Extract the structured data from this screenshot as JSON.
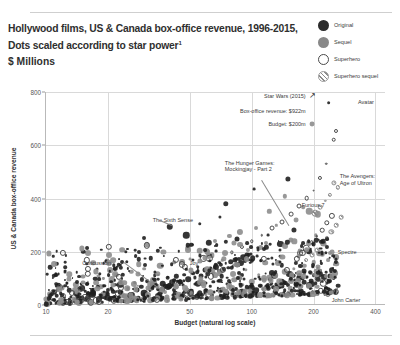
{
  "header": {
    "title_line1": "Hollywood films, US & Canada box-office revenue, 1996-2015,",
    "title_line2": "Dots scaled according to star power",
    "title_line2_footnote": "1",
    "units": "$ Millions"
  },
  "legend": {
    "position": "top-right",
    "items": [
      {
        "label": "Original",
        "marker": "filled-dark-circle",
        "color": "#2b2b2b"
      },
      {
        "label": "Sequel",
        "marker": "filled-gray-circle",
        "color": "#888888"
      },
      {
        "label": "Superhero",
        "marker": "hollow-circle",
        "color": "#4a4a4a"
      },
      {
        "label": "Superhero sequel",
        "marker": "hatched-circle",
        "color": "#8a8a8a"
      }
    ]
  },
  "chart_data": {
    "type": "scatter",
    "title": "Hollywood films, US & Canada box-office revenue, 1996-2015, Dots scaled according to star power",
    "subtitle": "$ Millions",
    "xlabel": "Budget (natural log scale)",
    "ylabel": "US & Canada box-office revenue",
    "xscale": "log",
    "xlim": [
      10,
      450
    ],
    "ylim": [
      0,
      800
    ],
    "xticks": [
      10,
      20,
      50,
      100,
      200,
      400
    ],
    "yticks": [
      0,
      200,
      400,
      600,
      800
    ],
    "grid": true,
    "size_encodes": "star power",
    "legend_position": "top-right",
    "series": [
      {
        "name": "Original",
        "marker": "filled-dark-circle"
      },
      {
        "name": "Sequel",
        "marker": "filled-gray-circle"
      },
      {
        "name": "Superhero",
        "marker": "hollow-circle"
      },
      {
        "name": "Superhero sequel",
        "marker": "hatched-circle"
      }
    ],
    "annotations": [
      {
        "label": "Star Wars (2015)",
        "detail_revenue": "Box-office revenue: $922m",
        "detail_budget": "Budget: $200m",
        "x": 200,
        "y": 922,
        "arrow": "up-right"
      },
      {
        "label": "Avatar",
        "x": 237,
        "y": 760
      },
      {
        "label": "The Avengers:",
        "label2": "Age of Ultron",
        "x": 250,
        "y": 459
      },
      {
        "label": "The Hunger Games:",
        "label2": "Mockingjay - Part 2",
        "x": 160,
        "y": 281
      },
      {
        "label": "Furious 7",
        "x": 190,
        "y": 353
      },
      {
        "label": "The Sixth Sense",
        "x": 40,
        "y": 293
      },
      {
        "label": "Concussion",
        "x": 35,
        "y": 34
      },
      {
        "label": "Joy",
        "x": 60,
        "y": 56
      },
      {
        "label": "Spectre",
        "x": 245,
        "y": 200
      },
      {
        "label": "John Carter",
        "x": 263,
        "y": 73
      }
    ],
    "points": {
      "original": [
        [
          237,
          760
        ],
        [
          150,
          474
        ],
        [
          40,
          293
        ],
        [
          103,
          436
        ],
        [
          75,
          380
        ],
        [
          70,
          330
        ],
        [
          56,
          305
        ],
        [
          48,
          262
        ],
        [
          30,
          250
        ],
        [
          36,
          215
        ],
        [
          62,
          234
        ],
        [
          85,
          248
        ],
        [
          95,
          232
        ],
        [
          120,
          262
        ],
        [
          138,
          230
        ],
        [
          160,
          281
        ],
        [
          175,
          220
        ],
        [
          200,
          230
        ],
        [
          190,
          200
        ],
        [
          215,
          212
        ],
        [
          230,
          196
        ],
        [
          263,
          73
        ],
        [
          210,
          140
        ],
        [
          180,
          128
        ],
        [
          160,
          110
        ],
        [
          140,
          150
        ],
        [
          125,
          120
        ],
        [
          110,
          96
        ],
        [
          100,
          165
        ],
        [
          90,
          112
        ],
        [
          80,
          140
        ],
        [
          70,
          92
        ],
        [
          60,
          105
        ],
        [
          52,
          120
        ],
        [
          45,
          88
        ],
        [
          40,
          72
        ],
        [
          35,
          60
        ],
        [
          30,
          44
        ],
        [
          26,
          38
        ],
        [
          22,
          50
        ],
        [
          19,
          34
        ],
        [
          17,
          60
        ],
        [
          15,
          28
        ],
        [
          14,
          44
        ],
        [
          13,
          22
        ],
        [
          12,
          36
        ],
        [
          11,
          18
        ],
        [
          10.5,
          30
        ],
        [
          10,
          12
        ],
        [
          12,
          8
        ],
        [
          14,
          16
        ],
        [
          16,
          24
        ],
        [
          18,
          14
        ],
        [
          20,
          28
        ],
        [
          22,
          20
        ],
        [
          24,
          34
        ],
        [
          26,
          18
        ],
        [
          28,
          26
        ],
        [
          30,
          12
        ],
        [
          33,
          22
        ],
        [
          36,
          30
        ],
        [
          39,
          16
        ],
        [
          42,
          26
        ],
        [
          45,
          36
        ],
        [
          48,
          20
        ],
        [
          52,
          30
        ],
        [
          56,
          44
        ],
        [
          60,
          24
        ],
        [
          64,
          38
        ],
        [
          68,
          52
        ],
        [
          72,
          30
        ],
        [
          76,
          46
        ],
        [
          80,
          60
        ],
        [
          85,
          34
        ],
        [
          90,
          50
        ],
        [
          95,
          66
        ],
        [
          100,
          40
        ],
        [
          105,
          56
        ],
        [
          110,
          72
        ],
        [
          115,
          44
        ],
        [
          120,
          62
        ],
        [
          125,
          80
        ],
        [
          130,
          50
        ],
        [
          135,
          68
        ],
        [
          140,
          88
        ],
        [
          145,
          56
        ],
        [
          150,
          74
        ],
        [
          155,
          94
        ],
        [
          160,
          62
        ],
        [
          165,
          80
        ],
        [
          170,
          100
        ],
        [
          175,
          70
        ],
        [
          180,
          86
        ],
        [
          185,
          106
        ],
        [
          190,
          76
        ],
        [
          195,
          92
        ],
        [
          200,
          112
        ],
        [
          205,
          82
        ],
        [
          210,
          98
        ],
        [
          215,
          118
        ],
        [
          220,
          88
        ],
        [
          225,
          104
        ],
        [
          230,
          124
        ],
        [
          235,
          94
        ],
        [
          240,
          110
        ],
        [
          245,
          130
        ],
        [
          250,
          100
        ],
        [
          35,
          34
        ],
        [
          60,
          56
        ],
        [
          11,
          48
        ],
        [
          13,
          56
        ],
        [
          15,
          64
        ],
        [
          17,
          46
        ],
        [
          19,
          70
        ],
        [
          21,
          58
        ],
        [
          23,
          76
        ],
        [
          25,
          62
        ],
        [
          27,
          84
        ],
        [
          29,
          68
        ],
        [
          31,
          90
        ],
        [
          33,
          74
        ],
        [
          35,
          96
        ],
        [
          37,
          80
        ],
        [
          39,
          102
        ],
        [
          41,
          86
        ],
        [
          43,
          108
        ],
        [
          45,
          92
        ],
        [
          47,
          114
        ],
        [
          49,
          98
        ],
        [
          51,
          120
        ],
        [
          53,
          104
        ],
        [
          55,
          126
        ],
        [
          57,
          110
        ],
        [
          59,
          132
        ],
        [
          61,
          116
        ],
        [
          63,
          138
        ],
        [
          65,
          122
        ],
        [
          67,
          144
        ],
        [
          69,
          128
        ],
        [
          71,
          150
        ],
        [
          73,
          134
        ],
        [
          75,
          156
        ],
        [
          77,
          140
        ],
        [
          79,
          162
        ],
        [
          81,
          146
        ],
        [
          83,
          168
        ],
        [
          85,
          152
        ],
        [
          87,
          174
        ],
        [
          89,
          158
        ],
        [
          91,
          180
        ],
        [
          93,
          164
        ],
        [
          95,
          186
        ],
        [
          97,
          170
        ],
        [
          99,
          192
        ],
        [
          101,
          176
        ],
        [
          10.2,
          6
        ],
        [
          10.8,
          20
        ],
        [
          11.5,
          10
        ],
        [
          12.3,
          26
        ],
        [
          13.1,
          14
        ],
        [
          14.2,
          32
        ],
        [
          15.4,
          18
        ],
        [
          16.8,
          38
        ],
        [
          18.2,
          24
        ],
        [
          19.8,
          44
        ],
        [
          21.5,
          28
        ],
        [
          23.4,
          50
        ],
        [
          25.5,
          32
        ],
        [
          27.8,
          56
        ],
        [
          30.2,
          36
        ],
        [
          32.9,
          62
        ],
        [
          35.8,
          40
        ],
        [
          39,
          68
        ],
        [
          42.5,
          44
        ],
        [
          46.3,
          74
        ],
        [
          50.4,
          48
        ],
        [
          54.9,
          80
        ],
        [
          59.8,
          52
        ],
        [
          65.1,
          86
        ],
        [
          70.9,
          56
        ],
        [
          77.2,
          92
        ],
        [
          84,
          60
        ],
        [
          91.5,
          98
        ],
        [
          99.6,
          64
        ],
        [
          108.5,
          104
        ],
        [
          118.1,
          68
        ],
        [
          128.6,
          110
        ],
        [
          140,
          72
        ],
        [
          152.4,
          116
        ],
        [
          166,
          76
        ],
        [
          180.7,
          122
        ],
        [
          196.7,
          80
        ],
        [
          214.2,
          128
        ],
        [
          233.1,
          84
        ]
      ],
      "sequel": [
        [
          196,
          681
        ],
        [
          145,
          408
        ],
        [
          178,
          368
        ],
        [
          122,
          352
        ],
        [
          210,
          340
        ],
        [
          165,
          320
        ],
        [
          132,
          300
        ],
        [
          105,
          288
        ],
        [
          88,
          276
        ],
        [
          240,
          196
        ],
        [
          225,
          230
        ],
        [
          190,
          353
        ],
        [
          205,
          262
        ],
        [
          155,
          244
        ],
        [
          118,
          232
        ],
        [
          96,
          208
        ],
        [
          74,
          196
        ],
        [
          62,
          184
        ],
        [
          50,
          172
        ],
        [
          42,
          160
        ],
        [
          36,
          148
        ],
        [
          30,
          136
        ],
        [
          26,
          124
        ],
        [
          22,
          112
        ],
        [
          19,
          100
        ],
        [
          16,
          88
        ],
        [
          14,
          76
        ],
        [
          12,
          64
        ],
        [
          11,
          52
        ],
        [
          10.5,
          40
        ],
        [
          200,
          160
        ],
        [
          180,
          148
        ],
        [
          160,
          136
        ],
        [
          145,
          124
        ],
        [
          130,
          112
        ],
        [
          115,
          100
        ],
        [
          100,
          88
        ],
        [
          90,
          76
        ],
        [
          80,
          64
        ],
        [
          70,
          52
        ],
        [
          60,
          40
        ],
        [
          52,
          28
        ],
        [
          44,
          36
        ],
        [
          38,
          48
        ],
        [
          32,
          60
        ],
        [
          28,
          72
        ],
        [
          24,
          84
        ],
        [
          21,
          96
        ],
        [
          18,
          108
        ],
        [
          250,
          150
        ],
        [
          235,
          170
        ],
        [
          220,
          190
        ],
        [
          215,
          130
        ],
        [
          230,
          110
        ],
        [
          245,
          200
        ],
        [
          195,
          120
        ],
        [
          175,
          106
        ],
        [
          155,
          92
        ],
        [
          138,
          78
        ],
        [
          122,
          96
        ],
        [
          108,
          114
        ],
        [
          94,
          132
        ],
        [
          82,
          150
        ],
        [
          72,
          168
        ],
        [
          64,
          186
        ],
        [
          56,
          204
        ],
        [
          50,
          222
        ],
        [
          66,
          240
        ],
        [
          78,
          258
        ]
      ],
      "superhero": [
        [
          258,
          654
        ],
        [
          250,
          620
        ],
        [
          230,
          530
        ],
        [
          215,
          478
        ],
        [
          200,
          430
        ],
        [
          185,
          402
        ],
        [
          170,
          370
        ],
        [
          155,
          340
        ],
        [
          140,
          310
        ],
        [
          126,
          288
        ],
        [
          112,
          262
        ],
        [
          100,
          240
        ],
        [
          90,
          218
        ],
        [
          80,
          198
        ],
        [
          245,
          336
        ],
        [
          232,
          308
        ],
        [
          220,
          282
        ],
        [
          208,
          258
        ],
        [
          196,
          236
        ],
        [
          184,
          214
        ],
        [
          172,
          194
        ]
      ],
      "superhero_sequel": [
        [
          250,
          459
        ],
        [
          262,
          442
        ],
        [
          240,
          415
        ],
        [
          228,
          390
        ],
        [
          216,
          368
        ],
        [
          204,
          344
        ],
        [
          272,
          330
        ],
        [
          258,
          300
        ],
        [
          244,
          274
        ],
        [
          232,
          250
        ],
        [
          220,
          228
        ],
        [
          208,
          206
        ],
        [
          196,
          186
        ],
        [
          184,
          168
        ]
      ]
    }
  },
  "axes": {
    "yticks": [
      "800",
      "600",
      "400",
      "200",
      "0"
    ],
    "xticks": [
      "10",
      "20",
      "50",
      "100",
      "200",
      "400"
    ],
    "ylabel": "US & Canada box-office revenue",
    "xlabel": "Budget (natural log scale)"
  }
}
